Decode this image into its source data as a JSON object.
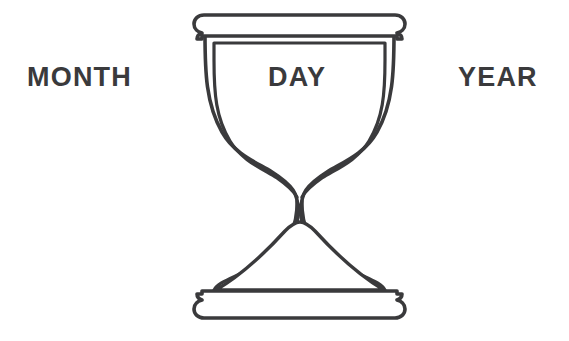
{
  "canvas": {
    "width": 569,
    "height": 341,
    "background_color": "#ffffff"
  },
  "labels": {
    "month": "MONTH",
    "day": "DAY",
    "year": "YEAR",
    "text_color": "#3a3a3c"
  },
  "illustration": {
    "name": "hourglass",
    "stroke_color": "#3a3a3c",
    "fill_color": "#ffffff",
    "parts": {
      "top_cap": "top-cap",
      "bottom_cap": "bottom-cap",
      "glass_body": "glass-body",
      "inner_chamber": "inner-chamber",
      "sand_mound": "sand-mound"
    }
  }
}
